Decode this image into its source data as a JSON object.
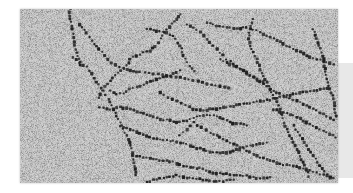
{
  "image": {
    "subject": "electron micrograph of chromatin fibers (beads-on-a-string nucleosomes)",
    "style": "grayscale, grainy speckled background with dark bead chains",
    "colors": {
      "page_background": "#ffffff",
      "micrograph_background": "#b9b9b9",
      "grain_light": "#e6e6e6",
      "grain_dark": "#7a7a7a",
      "bead": "#1e1e1e",
      "side_panel": "#e8e8e8"
    }
  },
  "fibers": [
    [
      [
        150,
        0
      ],
      [
        148,
        20
      ],
      [
        152,
        40
      ],
      [
        158,
        62
      ],
      [
        160,
        85
      ],
      [
        164,
        110
      ],
      [
        170,
        130
      ],
      [
        176,
        150
      ],
      [
        182,
        168
      ],
      [
        178,
        183
      ]
    ],
    [
      [
        480,
        15
      ],
      [
        470,
        30
      ],
      [
        455,
        45
      ],
      [
        440,
        60
      ],
      [
        428,
        80
      ],
      [
        415,
        100
      ],
      [
        405,
        112
      ],
      [
        390,
        125
      ],
      [
        370,
        132
      ],
      [
        350,
        140
      ],
      [
        330,
        150
      ]
    ],
    [
      [
        330,
        150
      ],
      [
        320,
        170
      ],
      [
        300,
        185
      ],
      [
        285,
        200
      ],
      [
        270,
        215
      ],
      [
        255,
        235
      ],
      [
        240,
        255
      ],
      [
        230,
        275
      ]
    ],
    [
      [
        270,
        245
      ],
      [
        290,
        255
      ],
      [
        310,
        252
      ],
      [
        330,
        240
      ],
      [
        360,
        232
      ],
      [
        380,
        222
      ],
      [
        400,
        215
      ],
      [
        430,
        205
      ],
      [
        460,
        195
      ],
      [
        490,
        180
      ]
    ],
    [
      [
        180,
        45
      ],
      [
        200,
        70
      ],
      [
        215,
        95
      ],
      [
        235,
        120
      ],
      [
        255,
        140
      ],
      [
        275,
        160
      ],
      [
        300,
        175
      ],
      [
        330,
        185
      ],
      [
        360,
        190
      ],
      [
        400,
        195
      ],
      [
        440,
        200
      ],
      [
        480,
        205
      ],
      [
        520,
        215
      ],
      [
        560,
        225
      ],
      [
        600,
        232
      ],
      [
        640,
        240
      ]
    ],
    [
      [
        380,
        60
      ],
      [
        410,
        65
      ],
      [
        440,
        70
      ],
      [
        460,
        80
      ],
      [
        475,
        100
      ],
      [
        485,
        120
      ],
      [
        490,
        140
      ],
      [
        500,
        160
      ],
      [
        515,
        180
      ],
      [
        530,
        195
      ]
    ],
    [
      [
        500,
        45
      ],
      [
        520,
        55
      ],
      [
        540,
        70
      ],
      [
        560,
        90
      ],
      [
        580,
        110
      ],
      [
        600,
        130
      ],
      [
        620,
        150
      ],
      [
        640,
        165
      ],
      [
        660,
        180
      ],
      [
        680,
        190
      ],
      [
        700,
        205
      ],
      [
        720,
        215
      ],
      [
        740,
        220
      ]
    ],
    [
      [
        560,
        40
      ],
      [
        590,
        50
      ],
      [
        620,
        55
      ],
      [
        650,
        60
      ],
      [
        680,
        55
      ],
      [
        710,
        65
      ],
      [
        740,
        80
      ],
      [
        770,
        95
      ],
      [
        800,
        110
      ],
      [
        830,
        125
      ],
      [
        860,
        140
      ],
      [
        890,
        150
      ],
      [
        920,
        160
      ],
      [
        950,
        170
      ]
    ],
    [
      [
        700,
        30
      ],
      [
        690,
        60
      ],
      [
        685,
        90
      ],
      [
        695,
        120
      ],
      [
        710,
        150
      ],
      [
        720,
        180
      ],
      [
        735,
        210
      ],
      [
        750,
        240
      ],
      [
        765,
        270
      ],
      [
        780,
        300
      ],
      [
        790,
        330
      ],
      [
        800,
        360
      ],
      [
        815,
        390
      ],
      [
        830,
        420
      ],
      [
        845,
        450
      ],
      [
        860,
        480
      ],
      [
        870,
        510
      ]
    ],
    [
      [
        160,
        145
      ],
      [
        180,
        160
      ],
      [
        200,
        175
      ],
      [
        215,
        195
      ],
      [
        230,
        220
      ],
      [
        250,
        245
      ],
      [
        265,
        270
      ],
      [
        280,
        300
      ],
      [
        295,
        330
      ],
      [
        310,
        360
      ],
      [
        325,
        390
      ],
      [
        335,
        420
      ],
      [
        340,
        450
      ],
      [
        345,
        480
      ],
      [
        350,
        510
      ]
    ],
    [
      [
        240,
        295
      ],
      [
        270,
        300
      ],
      [
        300,
        296
      ],
      [
        330,
        300
      ],
      [
        360,
        310
      ],
      [
        390,
        320
      ],
      [
        420,
        330
      ],
      [
        450,
        335
      ],
      [
        480,
        340
      ],
      [
        510,
        330
      ],
      [
        540,
        320
      ],
      [
        570,
        318
      ],
      [
        600,
        325
      ],
      [
        630,
        340
      ],
      [
        660,
        345
      ],
      [
        690,
        350
      ]
    ],
    [
      [
        300,
        350
      ],
      [
        330,
        360
      ],
      [
        360,
        372
      ],
      [
        390,
        385
      ],
      [
        420,
        392
      ],
      [
        450,
        395
      ],
      [
        480,
        400
      ],
      [
        510,
        410
      ],
      [
        540,
        420
      ],
      [
        570,
        430
      ],
      [
        600,
        432
      ],
      [
        630,
        428
      ],
      [
        660,
        420
      ],
      [
        690,
        410
      ],
      [
        720,
        405
      ],
      [
        750,
        400
      ]
    ],
    [
      [
        340,
        440
      ],
      [
        370,
        445
      ],
      [
        400,
        450
      ],
      [
        430,
        455
      ],
      [
        460,
        460
      ],
      [
        490,
        470
      ],
      [
        520,
        475
      ],
      [
        550,
        480
      ],
      [
        580,
        490
      ],
      [
        610,
        495
      ],
      [
        640,
        498
      ],
      [
        670,
        500
      ],
      [
        700,
        505
      ],
      [
        730,
        508
      ],
      [
        760,
        505
      ]
    ],
    [
      [
        420,
        250
      ],
      [
        445,
        265
      ],
      [
        470,
        275
      ],
      [
        495,
        290
      ],
      [
        520,
        300
      ],
      [
        550,
        305
      ],
      [
        580,
        300
      ],
      [
        610,
        295
      ],
      [
        640,
        290
      ],
      [
        670,
        285
      ],
      [
        700,
        280
      ],
      [
        730,
        275
      ],
      [
        760,
        270
      ],
      [
        790,
        262
      ],
      [
        820,
        255
      ],
      [
        850,
        250
      ],
      [
        880,
        245
      ],
      [
        910,
        240
      ],
      [
        940,
        235
      ]
    ],
    [
      [
        600,
        150
      ],
      [
        630,
        165
      ],
      [
        660,
        180
      ],
      [
        690,
        200
      ],
      [
        720,
        220
      ],
      [
        750,
        240
      ],
      [
        780,
        255
      ],
      [
        810,
        268
      ],
      [
        840,
        280
      ],
      [
        870,
        295
      ],
      [
        900,
        310
      ],
      [
        930,
        325
      ],
      [
        950,
        340
      ]
    ],
    [
      [
        480,
        380
      ],
      [
        500,
        360
      ],
      [
        520,
        340
      ],
      [
        545,
        355
      ],
      [
        570,
        370
      ],
      [
        600,
        385
      ],
      [
        630,
        400
      ],
      [
        660,
        415
      ],
      [
        690,
        430
      ],
      [
        720,
        445
      ],
      [
        750,
        455
      ],
      [
        780,
        465
      ],
      [
        810,
        470
      ],
      [
        840,
        475
      ],
      [
        870,
        485
      ],
      [
        900,
        495
      ],
      [
        930,
        505
      ],
      [
        950,
        510
      ]
    ],
    [
      [
        760,
        300
      ],
      [
        790,
        310
      ],
      [
        820,
        320
      ],
      [
        850,
        335
      ],
      [
        880,
        350
      ],
      [
        910,
        365
      ],
      [
        940,
        380
      ],
      [
        950,
        395
      ]
    ],
    [
      [
        820,
        350
      ],
      [
        840,
        380
      ],
      [
        860,
        410
      ],
      [
        880,
        440
      ],
      [
        900,
        470
      ],
      [
        920,
        495
      ],
      [
        940,
        515
      ]
    ],
    [
      [
        880,
        60
      ],
      [
        890,
        90
      ],
      [
        900,
        120
      ],
      [
        910,
        150
      ],
      [
        915,
        180
      ],
      [
        920,
        210
      ],
      [
        930,
        240
      ],
      [
        940,
        270
      ],
      [
        945,
        300
      ],
      [
        950,
        330
      ]
    ],
    [
      [
        380,
        520
      ],
      [
        410,
        510
      ],
      [
        440,
        505
      ],
      [
        470,
        500
      ],
      [
        500,
        505
      ],
      [
        530,
        510
      ],
      [
        560,
        515
      ],
      [
        590,
        518
      ],
      [
        620,
        515
      ],
      [
        650,
        510
      ]
    ]
  ],
  "side_panel": {
    "visible": true
  }
}
